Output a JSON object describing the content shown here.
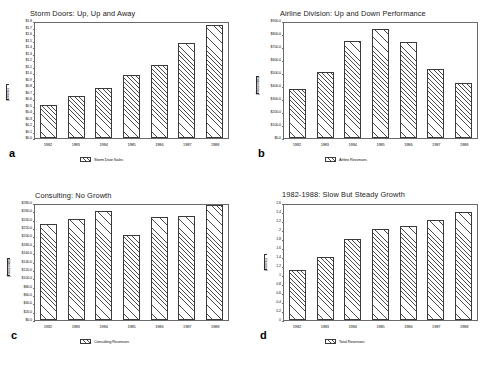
{
  "figure": {
    "background": "#ffffff",
    "bar_edge_color": "#3a3a3a",
    "frame_color": "#6a6a6a",
    "text_color": "#111111"
  },
  "panels": [
    {
      "letter": "a",
      "legend_label": "Storm Door Sales",
      "chart_data": {
        "type": "bar",
        "title": "Storm Doors: Up, Up and Away",
        "xlabel": "",
        "ylabel": "(Millions)",
        "categories": [
          "1982",
          "1983",
          "1984",
          "1985",
          "1986",
          "1987",
          "1988"
        ],
        "values": [
          0.52,
          0.66,
          0.79,
          0.99,
          1.15,
          1.48,
          1.77
        ],
        "ylim": [
          0.0,
          1.8
        ],
        "ytick_values": [
          0.0,
          0.1,
          0.2,
          0.3,
          0.4,
          0.5,
          0.6,
          0.7,
          0.8,
          0.9,
          1.0,
          1.1,
          1.2,
          1.3,
          1.4,
          1.5,
          1.6,
          1.7,
          1.8
        ],
        "ytick_labels": [
          "$0.0",
          "$0.1",
          "$0.2",
          "$0.3",
          "$0.4",
          "$0.5",
          "$0.6",
          "$0.7",
          "$0.8",
          "$0.9",
          "$1.0",
          "$1.1",
          "$1.2",
          "$1.3",
          "$1.4",
          "$1.5",
          "$1.6",
          "$1.7",
          "$1.8"
        ],
        "grid": false,
        "legend_position": "below"
      }
    },
    {
      "letter": "b",
      "legend_label": "Airline Revenues",
      "chart_data": {
        "type": "bar",
        "title": "Airline Division: Up and Down Performance",
        "xlabel": "",
        "ylabel": "(Thousands)",
        "categories": [
          "1982",
          "1983",
          "1984",
          "1985",
          "1986",
          "1987",
          "1988"
        ],
        "values": [
          380,
          520,
          760,
          850,
          750,
          540,
          430
        ],
        "ylim": [
          0.0,
          900.0
        ],
        "ytick_values": [
          0,
          100,
          200,
          300,
          400,
          500,
          600,
          700,
          800,
          900
        ],
        "ytick_labels": [
          "$0.0",
          "$100.0",
          "$200.0",
          "$300.0",
          "$400.0",
          "$500.0",
          "$600.0",
          "$700.0",
          "$800.0",
          "$900.0"
        ],
        "grid": false,
        "legend_position": "below"
      }
    },
    {
      "letter": "c",
      "legend_label": "Consulting Revenues",
      "chart_data": {
        "type": "bar",
        "title": "Consulting: No Growth",
        "xlabel": "",
        "ylabel": "(Thousands)",
        "categories": [
          "1982",
          "1983",
          "1984",
          "1985",
          "1986",
          "1987",
          "1988"
        ],
        "values": [
          234,
          247,
          265,
          206,
          250,
          253,
          280
        ],
        "ylim": [
          0.0,
          280.0
        ],
        "ytick_values": [
          0,
          20,
          40,
          60,
          80,
          100,
          120,
          140,
          160,
          180,
          200,
          220,
          240,
          260,
          280
        ],
        "ytick_labels": [
          "$0.0",
          "$20.0",
          "$40.0",
          "$60.0",
          "$80.0",
          "$100.0",
          "$120.0",
          "$140.0",
          "$160.0",
          "$180.0",
          "$200.0",
          "$220.0",
          "$240.0",
          "$260.0",
          "$280.0"
        ],
        "grid": false,
        "legend_position": "below"
      }
    },
    {
      "letter": "d",
      "legend_label": "Total Revenues",
      "chart_data": {
        "type": "bar",
        "title": "1982-1988: Slow But Steady Growth",
        "xlabel": "",
        "ylabel": "(Millions)",
        "categories": [
          "1982",
          "1983",
          "1984",
          "1985",
          "1986",
          "1987",
          "1988"
        ],
        "values": [
          1.12,
          1.43,
          1.84,
          2.06,
          2.13,
          2.26,
          2.45
        ],
        "ylim": [
          0.0,
          2.6
        ],
        "ytick_values": [
          0,
          0.2,
          0.4,
          0.6,
          0.8,
          1.0,
          1.2,
          1.4,
          1.6,
          1.8,
          2.0,
          2.2,
          2.4,
          2.6
        ],
        "ytick_labels": [
          "0",
          "0.2",
          "0.4",
          "0.6",
          "0.8",
          "1",
          "1.2",
          "1.4",
          "1.6",
          "1.8",
          "2",
          "2.2",
          "2.4",
          "2.6"
        ],
        "grid": false,
        "legend_position": "below"
      }
    }
  ]
}
